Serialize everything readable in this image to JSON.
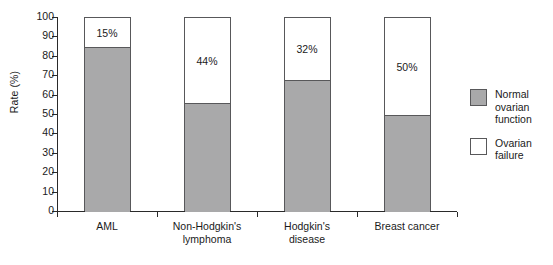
{
  "chart_data": {
    "type": "bar",
    "subtype": "stacked-bar",
    "title": "",
    "xlabel": "",
    "ylabel": "Rate (%)",
    "ylim": [
      0,
      100
    ],
    "ytick_labels": [
      "100",
      "90",
      "80",
      "70",
      "60",
      "50",
      "40",
      "30",
      "20",
      "10",
      "0"
    ],
    "ytick_values": [
      100,
      90,
      80,
      70,
      60,
      50,
      40,
      30,
      20,
      10,
      0
    ],
    "grid": false,
    "legend_position": "right",
    "categories": [
      "AML",
      "Non-Hodgkin's\nlymphoma",
      "Hodgkin's\ndisease",
      "Breast cancer"
    ],
    "series": [
      {
        "name": "Normal ovarian\nfunction",
        "color": "#a9a9aa",
        "values": [
          85,
          56,
          68,
          50
        ],
        "labels": [
          "",
          "",
          "",
          ""
        ]
      },
      {
        "name": "Ovarian failure",
        "color": "#ffffff",
        "values": [
          15,
          44,
          32,
          50
        ],
        "labels": [
          "15%",
          "44%",
          "32%",
          "50%"
        ]
      }
    ]
  },
  "legend": {
    "entries": [
      {
        "label": "Normal ovarian\nfunction",
        "swatch_color": "#a9a9aa"
      },
      {
        "label": "Ovarian failure",
        "swatch_color": "#ffffff"
      }
    ]
  },
  "colors": {
    "normal_ovarian_function": "#a9a9aa",
    "ovarian_failure": "#ffffff",
    "axis": "#2a2a2a",
    "bar_outline": "#58585a",
    "background": "#ffffff"
  }
}
